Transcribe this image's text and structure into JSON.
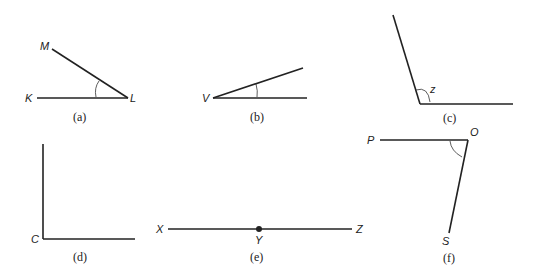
{
  "figure": {
    "panels": [
      {
        "id": "a",
        "caption": "(a)",
        "points": [
          "M",
          "K",
          "L"
        ],
        "vertex": "L",
        "type": "acute angle"
      },
      {
        "id": "b",
        "caption": "(b)",
        "points": [
          "V"
        ],
        "vertex": "V",
        "type": "acute angle"
      },
      {
        "id": "c",
        "caption": "(c)",
        "points": [
          "z"
        ],
        "vertex": "z",
        "type": "obtuse angle"
      },
      {
        "id": "d",
        "caption": "(d)",
        "points": [
          "C"
        ],
        "vertex": "C",
        "type": "right angle"
      },
      {
        "id": "e",
        "caption": "(e)",
        "points": [
          "X",
          "Y",
          "Z"
        ],
        "vertex": "Y",
        "type": "straight angle"
      },
      {
        "id": "f",
        "caption": "(f)",
        "points": [
          "P",
          "O",
          "S"
        ],
        "vertex": "O",
        "type": "acute angle"
      }
    ]
  }
}
